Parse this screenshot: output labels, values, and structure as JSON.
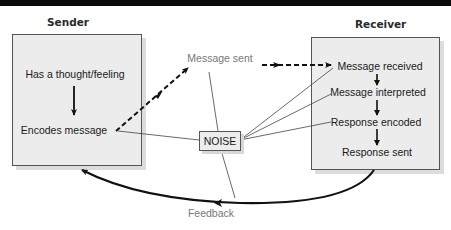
{
  "diagram": {
    "sender": {
      "title": "Sender",
      "steps": [
        "Has a thought/feeling",
        "Encodes message"
      ]
    },
    "receiver": {
      "title": "Receiver",
      "steps": [
        "Message received",
        "Message interpreted",
        "Response encoded",
        "Response sent"
      ]
    },
    "channel": {
      "message_label": "Message sent",
      "noise_label": "NOISE",
      "feedback_label": "Feedback"
    },
    "colors": {
      "box_fill": "#ececec",
      "box_border": "#555555",
      "arrow": "#111111",
      "thin_line": "#444444",
      "grey_text": "#777777",
      "top_bar": "#0a0a0a"
    }
  }
}
